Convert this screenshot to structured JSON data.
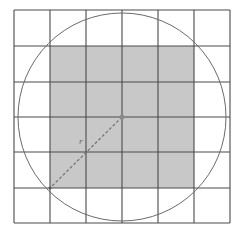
{
  "diagram": {
    "type": "circle-inscribed-grid",
    "grid": {
      "columns": 6,
      "rows": 6,
      "x_lines": [
        14,
        50,
        86,
        122,
        158,
        194,
        230
      ],
      "y_lines": [
        10,
        46,
        82,
        117,
        152,
        188,
        223
      ],
      "line_color": "#4a4a4a"
    },
    "shaded_square": {
      "x": 50,
      "y": 46,
      "width": 144,
      "height": 142,
      "fill": "#c8c8c8"
    },
    "circle": {
      "cx": 122,
      "cy": 117,
      "r": 104,
      "stroke": "#6a6a6a"
    },
    "center_point": {
      "cx": 122,
      "cy": 117,
      "color": "#8a8a8a"
    },
    "radius_line": {
      "x1": 122,
      "y1": 117,
      "x2": 50,
      "y2": 188,
      "stroke": "#777777",
      "label": "r"
    }
  }
}
